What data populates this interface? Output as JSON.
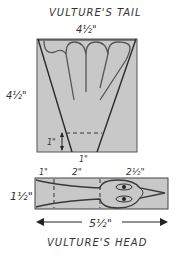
{
  "tail": {
    "title": "VULTURE'S TAIL",
    "width_label": "4½\"",
    "height_label": "4½\"",
    "base_height_label": "1\"",
    "base_width_label": "1\""
  },
  "head": {
    "title": "VULTURE'S HEAD",
    "seg1_label": "1\"",
    "seg2_label": "2\"",
    "seg3_label": "2½\"",
    "height_label": "1½\"",
    "total_width_label": "5½\""
  },
  "colors": {
    "fill": "#c8c8c8",
    "stroke": "#3a3a3a",
    "background": "#ffffff"
  }
}
